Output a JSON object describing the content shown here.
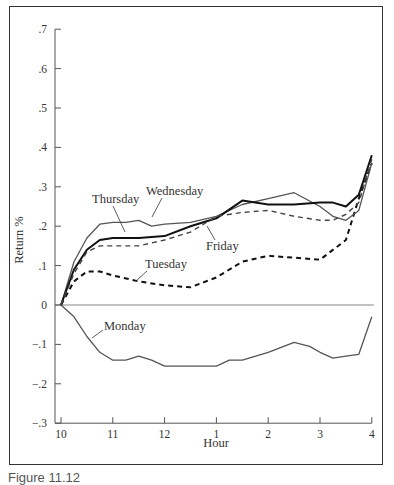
{
  "chart_data": {
    "type": "line",
    "title": "",
    "xlabel": "Hour",
    "ylabel": "Return %",
    "x_ticks": [
      "10",
      "11",
      "12",
      "1",
      "2",
      "3",
      "4"
    ],
    "y_ticks": [
      ".7",
      ".6",
      ".5",
      ".4",
      ".3",
      ".2",
      ".1",
      "0",
      "-.1",
      "-.2",
      "-.3"
    ],
    "ylim": [
      -0.3,
      0.7
    ],
    "xlim": [
      10,
      16
    ],
    "grid": false,
    "legend": "inline labels",
    "series": [
      {
        "name": "Monday",
        "style": "solid-thin",
        "x": [
          10,
          10.25,
          10.5,
          10.75,
          11,
          11.25,
          11.5,
          11.75,
          12,
          12.5,
          13,
          13.25,
          13.5,
          14,
          14.5,
          14.8,
          15,
          15.25,
          15.5,
          15.75,
          16
        ],
        "y": [
          0,
          -0.03,
          -0.08,
          -0.12,
          -0.14,
          -0.14,
          -0.13,
          -0.14,
          -0.155,
          -0.155,
          -0.155,
          -0.14,
          -0.14,
          -0.12,
          -0.095,
          -0.105,
          -0.12,
          -0.135,
          -0.13,
          -0.125,
          -0.03
        ]
      },
      {
        "name": "Tuesday",
        "style": "dashed-heavy",
        "x": [
          10,
          10.25,
          10.5,
          10.75,
          11,
          11.5,
          12,
          12.5,
          13,
          13.5,
          14,
          14.5,
          15,
          15.5,
          15.75,
          16
        ],
        "y": [
          0,
          0.06,
          0.085,
          0.085,
          0.075,
          0.06,
          0.05,
          0.045,
          0.07,
          0.11,
          0.125,
          0.12,
          0.115,
          0.165,
          0.27,
          0.36
        ]
      },
      {
        "name": "Wednesday",
        "style": "solid-thin",
        "x": [
          10,
          10.25,
          10.5,
          10.75,
          11,
          11.25,
          11.5,
          11.75,
          12,
          12.5,
          13,
          13.5,
          14,
          14.5,
          15,
          15.25,
          15.5,
          15.75,
          16
        ],
        "y": [
          0,
          0.11,
          0.17,
          0.205,
          0.21,
          0.21,
          0.215,
          0.2,
          0.205,
          0.21,
          0.225,
          0.255,
          0.27,
          0.285,
          0.25,
          0.225,
          0.215,
          0.24,
          0.36
        ]
      },
      {
        "name": "Thursday",
        "style": "solid-heavy",
        "x": [
          10,
          10.25,
          10.5,
          10.75,
          11,
          11.5,
          12,
          12.5,
          13,
          13.5,
          14,
          14.5,
          15,
          15.25,
          15.5,
          15.75,
          16
        ],
        "y": [
          0,
          0.09,
          0.14,
          0.165,
          0.17,
          0.17,
          0.175,
          0.2,
          0.22,
          0.265,
          0.255,
          0.255,
          0.26,
          0.26,
          0.25,
          0.28,
          0.38
        ]
      },
      {
        "name": "Friday",
        "style": "dashed-thin",
        "x": [
          10,
          10.25,
          10.5,
          10.75,
          11,
          11.5,
          12,
          12.5,
          13,
          13.5,
          14,
          14.5,
          15,
          15.25,
          15.5,
          15.75,
          16
        ],
        "y": [
          0,
          0.08,
          0.135,
          0.15,
          0.15,
          0.15,
          0.165,
          0.185,
          0.225,
          0.235,
          0.24,
          0.225,
          0.215,
          0.215,
          0.23,
          0.26,
          0.37
        ]
      }
    ],
    "annotations": [
      {
        "text": "Wednesday"
      },
      {
        "text": "Thursday"
      },
      {
        "text": "Friday"
      },
      {
        "text": "Tuesday"
      },
      {
        "text": "Monday"
      }
    ]
  },
  "labels": {
    "ylabel": "Return %",
    "xlabel": "Hour",
    "monday": "Monday",
    "tuesday": "Tuesday",
    "wednesday": "Wednesday",
    "thursday": "Thursday",
    "friday": "Friday",
    "caption": "Figure 11.12"
  }
}
